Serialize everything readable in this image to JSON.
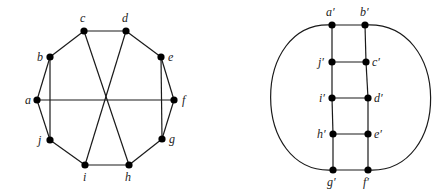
{
  "graphs": [
    {
      "name": "petersen-style-10-cycle",
      "nodes": [
        {
          "id": "a",
          "label": "a",
          "x": 37,
          "y": 100,
          "lx": 25,
          "ly": 104
        },
        {
          "id": "b",
          "label": "b",
          "x": 50,
          "y": 57,
          "lx": 37,
          "ly": 61
        },
        {
          "id": "c",
          "label": "c",
          "x": 84,
          "y": 31,
          "lx": 80,
          "ly": 22
        },
        {
          "id": "d",
          "label": "d",
          "x": 126,
          "y": 31,
          "lx": 122,
          "ly": 22
        },
        {
          "id": "e",
          "label": "e",
          "x": 161,
          "y": 57,
          "lx": 168,
          "ly": 61
        },
        {
          "id": "f",
          "label": "f",
          "x": 174,
          "y": 100,
          "lx": 182,
          "ly": 104
        },
        {
          "id": "g",
          "label": "g",
          "x": 162,
          "y": 139,
          "lx": 169,
          "ly": 143
        },
        {
          "id": "h",
          "label": "h",
          "x": 129,
          "y": 165,
          "lx": 125,
          "ly": 181
        },
        {
          "id": "i",
          "label": "i",
          "x": 85,
          "y": 165,
          "lx": 83,
          "ly": 181
        },
        {
          "id": "j",
          "label": "j",
          "x": 50,
          "y": 140,
          "lx": 38,
          "ly": 144
        }
      ],
      "edges": [
        [
          "a",
          "b"
        ],
        [
          "b",
          "c"
        ],
        [
          "c",
          "d"
        ],
        [
          "d",
          "e"
        ],
        [
          "e",
          "f"
        ],
        [
          "f",
          "g"
        ],
        [
          "g",
          "h"
        ],
        [
          "h",
          "i"
        ],
        [
          "i",
          "j"
        ],
        [
          "j",
          "a"
        ],
        [
          "b",
          "j"
        ],
        [
          "e",
          "g"
        ],
        [
          "a",
          "f"
        ],
        [
          "c",
          "h"
        ],
        [
          "d",
          "i"
        ]
      ]
    },
    {
      "name": "ladder-graph",
      "nodes": [
        {
          "id": "a'",
          "label": "a′",
          "x": 332,
          "y": 25,
          "lx": 326,
          "ly": 16
        },
        {
          "id": "b'",
          "label": "b′",
          "x": 365,
          "y": 25,
          "lx": 360,
          "ly": 16
        },
        {
          "id": "j'",
          "label": "j′",
          "x": 332,
          "y": 62,
          "lx": 318,
          "ly": 66
        },
        {
          "id": "c'",
          "label": "c′",
          "x": 366,
          "y": 62,
          "lx": 372,
          "ly": 66
        },
        {
          "id": "i'",
          "label": "i′",
          "x": 332,
          "y": 98,
          "lx": 319,
          "ly": 102
        },
        {
          "id": "d'",
          "label": "d′",
          "x": 368,
          "y": 98,
          "lx": 374,
          "ly": 102
        },
        {
          "id": "h'",
          "label": "h′",
          "x": 333,
          "y": 134,
          "lx": 317,
          "ly": 138
        },
        {
          "id": "e'",
          "label": "e′",
          "x": 368,
          "y": 134,
          "lx": 374,
          "ly": 138
        },
        {
          "id": "g'",
          "label": "g′",
          "x": 333,
          "y": 170,
          "lx": 327,
          "ly": 186
        },
        {
          "id": "f'",
          "label": "f′",
          "x": 368,
          "y": 170,
          "lx": 363,
          "ly": 186
        }
      ],
      "edges": [
        [
          "a'",
          "b'"
        ],
        [
          "j'",
          "c'"
        ],
        [
          "i'",
          "d'"
        ],
        [
          "h'",
          "e'"
        ],
        [
          "g'",
          "f'"
        ],
        [
          "a'",
          "j'"
        ],
        [
          "j'",
          "i'"
        ],
        [
          "i'",
          "h'"
        ],
        [
          "h'",
          "g'"
        ],
        [
          "b'",
          "c'"
        ],
        [
          "c'",
          "d'"
        ],
        [
          "d'",
          "e'"
        ],
        [
          "e'",
          "f'"
        ]
      ],
      "curved_edges": [
        {
          "from": "a'",
          "to": "g'",
          "side": "left",
          "path": "M 332 25 C 250 20, 250 175, 333 170"
        },
        {
          "from": "b'",
          "to": "f'",
          "side": "right",
          "path": "M 365 25 C 452 20, 452 175, 368 170"
        }
      ]
    }
  ]
}
